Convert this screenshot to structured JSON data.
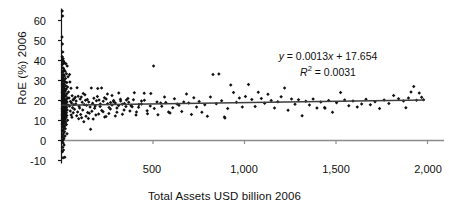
{
  "chart_data": {
    "type": "scatter",
    "title": "",
    "xlabel": "Total Assets USD billion 2006",
    "ylabel": "RoE (%) 2006",
    "xlim": [
      0,
      2000
    ],
    "ylim": [
      -10,
      65
    ],
    "xticks": [
      500,
      1000,
      1500,
      2000
    ],
    "xticklabels": [
      "500",
      "1,000",
      "1,500",
      "2,000"
    ],
    "yticks": [
      -10,
      0,
      10,
      20,
      30,
      40,
      50,
      60
    ],
    "yticklabels": [
      "-10",
      "0",
      "10",
      "20",
      "30",
      "40",
      "50",
      "60"
    ],
    "grid": false,
    "legend": null,
    "marker": "filled-diamond",
    "marker_color": "#111111",
    "trendline": {
      "slope": 0.0013,
      "intercept": 17.654,
      "r_squared": 0.0031,
      "color": "#3d3d3d",
      "x_start": 0,
      "x_end": 1985
    },
    "annotations": {
      "equation_y": "y",
      "equation_body": " = 0.0013",
      "equation_x": "x",
      "equation_tail": " + 17.654",
      "r2_symbol": "R",
      "r2_sup": "2",
      "r2_value": " = 0.0031"
    },
    "points": [
      [
        4,
        64.8
      ],
      [
        6,
        62.3
      ],
      [
        3,
        51.8
      ],
      [
        5,
        48.2
      ],
      [
        7,
        44.3
      ],
      [
        4,
        41.9
      ],
      [
        9,
        40.9
      ],
      [
        6,
        40.1
      ],
      [
        12,
        39.6
      ],
      [
        8,
        38.6
      ],
      [
        5,
        38.0
      ],
      [
        17,
        38.8
      ],
      [
        24,
        38.4
      ],
      [
        31,
        37.2
      ],
      [
        7,
        36.4
      ],
      [
        11,
        36.0
      ],
      [
        14,
        35.3
      ],
      [
        9,
        34.8
      ],
      [
        20,
        34.6
      ],
      [
        5,
        34.1
      ],
      [
        27,
        33.4
      ],
      [
        12,
        33.0
      ],
      [
        8,
        32.6
      ],
      [
        16,
        32.2
      ],
      [
        36,
        31.9
      ],
      [
        6,
        31.5
      ],
      [
        22,
        31.0
      ],
      [
        10,
        30.6
      ],
      [
        44,
        33.0
      ],
      [
        13,
        30.1
      ],
      [
        7,
        29.7
      ],
      [
        19,
        29.4
      ],
      [
        29,
        29.0
      ],
      [
        9,
        28.6
      ],
      [
        15,
        28.2
      ],
      [
        5,
        27.8
      ],
      [
        23,
        27.4
      ],
      [
        11,
        27.0
      ],
      [
        33,
        26.7
      ],
      [
        8,
        26.4
      ],
      [
        17,
        26.0
      ],
      [
        26,
        25.7
      ],
      [
        6,
        25.3
      ],
      [
        13,
        25.0
      ],
      [
        21,
        24.7
      ],
      [
        9,
        24.3
      ],
      [
        38,
        24.2
      ],
      [
        4,
        24.0
      ],
      [
        15,
        23.7
      ],
      [
        29,
        23.4
      ],
      [
        11,
        23.1
      ],
      [
        7,
        22.8
      ],
      [
        19,
        22.5
      ],
      [
        24,
        22.3
      ],
      [
        9,
        22.0
      ],
      [
        14,
        21.8
      ],
      [
        5,
        21.5
      ],
      [
        32,
        21.3
      ],
      [
        12,
        21.0
      ],
      [
        8,
        20.8
      ],
      [
        18,
        20.6
      ],
      [
        26,
        20.4
      ],
      [
        10,
        20.2
      ],
      [
        6,
        20.0
      ],
      [
        22,
        19.8
      ],
      [
        14,
        19.6
      ],
      [
        4,
        19.4
      ],
      [
        30,
        19.2
      ],
      [
        9,
        19.0
      ],
      [
        16,
        18.9
      ],
      [
        7,
        18.7
      ],
      [
        20,
        18.5
      ],
      [
        11,
        18.3
      ],
      [
        25,
        18.1
      ],
      [
        5,
        18.0
      ],
      [
        13,
        17.8
      ],
      [
        35,
        17.7
      ],
      [
        8,
        17.5
      ],
      [
        18,
        17.4
      ],
      [
        10,
        17.2
      ],
      [
        23,
        17.0
      ],
      [
        6,
        16.9
      ],
      [
        15,
        16.7
      ],
      [
        28,
        16.5
      ],
      [
        9,
        16.3
      ],
      [
        12,
        16.1
      ],
      [
        4,
        16.0
      ],
      [
        20,
        15.8
      ],
      [
        7,
        15.6
      ],
      [
        17,
        15.4
      ],
      [
        31,
        15.3
      ],
      [
        11,
        15.1
      ],
      [
        24,
        14.9
      ],
      [
        5,
        14.7
      ],
      [
        14,
        14.5
      ],
      [
        8,
        14.3
      ],
      [
        19,
        14.1
      ],
      [
        27,
        13.9
      ],
      [
        10,
        13.7
      ],
      [
        6,
        13.5
      ],
      [
        16,
        13.3
      ],
      [
        22,
        13.1
      ],
      [
        12,
        12.9
      ],
      [
        4,
        12.7
      ],
      [
        29,
        12.5
      ],
      [
        9,
        12.3
      ],
      [
        18,
        12.1
      ],
      [
        7,
        11.9
      ],
      [
        14,
        11.7
      ],
      [
        25,
        11.5
      ],
      [
        11,
        11.3
      ],
      [
        5,
        11.0
      ],
      [
        20,
        10.8
      ],
      [
        8,
        10.6
      ],
      [
        16,
        10.3
      ],
      [
        33,
        10.1
      ],
      [
        12,
        9.8
      ],
      [
        6,
        9.5
      ],
      [
        23,
        9.2
      ],
      [
        9,
        8.9
      ],
      [
        15,
        8.6
      ],
      [
        4,
        8.3
      ],
      [
        27,
        8.0
      ],
      [
        11,
        7.6
      ],
      [
        18,
        7.2
      ],
      [
        7,
        6.8
      ],
      [
        13,
        6.3
      ],
      [
        21,
        5.9
      ],
      [
        9,
        5.4
      ],
      [
        5,
        4.9
      ],
      [
        16,
        4.4
      ],
      [
        11,
        3.8
      ],
      [
        30,
        3.4
      ],
      [
        8,
        2.9
      ],
      [
        19,
        2.3
      ],
      [
        6,
        1.7
      ],
      [
        13,
        1.1
      ],
      [
        10,
        0.4
      ],
      [
        4,
        -0.3
      ],
      [
        9,
        -1.2
      ],
      [
        14,
        -2.3
      ],
      [
        7,
        -3.4
      ],
      [
        11,
        -4.8
      ],
      [
        5,
        -5.6
      ],
      [
        9,
        -8.6
      ],
      [
        18,
        -8.4
      ],
      [
        46,
        29.3
      ],
      [
        52,
        26.1
      ],
      [
        58,
        22.4
      ],
      [
        41,
        21.2
      ],
      [
        63,
        20.3
      ],
      [
        49,
        19.5
      ],
      [
        55,
        18.7
      ],
      [
        67,
        17.9
      ],
      [
        44,
        17.2
      ],
      [
        60,
        16.4
      ],
      [
        71,
        15.6
      ],
      [
        48,
        14.8
      ],
      [
        64,
        13.9
      ],
      [
        53,
        12.8
      ],
      [
        75,
        21.6
      ],
      [
        69,
        20.9
      ],
      [
        57,
        11.6
      ],
      [
        80,
        19.8
      ],
      [
        85,
        26.4
      ],
      [
        91,
        22.1
      ],
      [
        78,
        18.3
      ],
      [
        96,
        17.1
      ],
      [
        88,
        14.2
      ],
      [
        102,
        20.7
      ],
      [
        83,
        12.4
      ],
      [
        108,
        21.8
      ],
      [
        99,
        16.2
      ],
      [
        113,
        19.1
      ],
      [
        105,
        13.0
      ],
      [
        119,
        23.5
      ],
      [
        94,
        10.9
      ],
      [
        124,
        18.0
      ],
      [
        116,
        15.3
      ],
      [
        131,
        20.1
      ],
      [
        110,
        11.4
      ],
      [
        137,
        17.6
      ],
      [
        128,
        22.9
      ],
      [
        143,
        14.0
      ],
      [
        122,
        9.4
      ],
      [
        149,
        19.3
      ],
      [
        134,
        12.1
      ],
      [
        156,
        16.8
      ],
      [
        141,
        20.5
      ],
      [
        163,
        26.3
      ],
      [
        147,
        11.0
      ],
      [
        170,
        18.6
      ],
      [
        152,
        13.6
      ],
      [
        177,
        21.1
      ],
      [
        159,
        5.6
      ],
      [
        184,
        17.3
      ],
      [
        166,
        14.6
      ],
      [
        191,
        19.9
      ],
      [
        173,
        10.8
      ],
      [
        198,
        26.0
      ],
      [
        181,
        16.1
      ],
      [
        205,
        20.3
      ],
      [
        188,
        12.7
      ],
      [
        212,
        18.2
      ],
      [
        196,
        22.0
      ],
      [
        220,
        15.0
      ],
      [
        203,
        13.2
      ],
      [
        228,
        19.6
      ],
      [
        211,
        17.0
      ],
      [
        236,
        11.8
      ],
      [
        219,
        26.2
      ],
      [
        244,
        20.8
      ],
      [
        227,
        14.4
      ],
      [
        252,
        18.4
      ],
      [
        235,
        21.4
      ],
      [
        260,
        16.5
      ],
      [
        243,
        12.0
      ],
      [
        268,
        19.0
      ],
      [
        251,
        23.3
      ],
      [
        276,
        17.8
      ],
      [
        259,
        13.5
      ],
      [
        285,
        20.0
      ],
      [
        267,
        15.7
      ],
      [
        294,
        18.8
      ],
      [
        276,
        22.5
      ],
      [
        303,
        14.1
      ],
      [
        285,
        19.4
      ],
      [
        312,
        17.5
      ],
      [
        294,
        12.3
      ],
      [
        322,
        20.6
      ],
      [
        303,
        16.3
      ],
      [
        332,
        18.1
      ],
      [
        313,
        23.8
      ],
      [
        342,
        15.2
      ],
      [
        323,
        19.7
      ],
      [
        352,
        17.0
      ],
      [
        333,
        13.1
      ],
      [
        363,
        21.0
      ],
      [
        344,
        18.5
      ],
      [
        374,
        14.7
      ],
      [
        355,
        20.2
      ],
      [
        386,
        16.9
      ],
      [
        367,
        19.1
      ],
      [
        398,
        23.9
      ],
      [
        380,
        17.4
      ],
      [
        410,
        14.3
      ],
      [
        393,
        20.4
      ],
      [
        423,
        18.0
      ],
      [
        407,
        12.8
      ],
      [
        437,
        19.8
      ],
      [
        421,
        16.6
      ],
      [
        452,
        23.6
      ],
      [
        437,
        18.3
      ],
      [
        468,
        14.9
      ],
      [
        453,
        20.1
      ],
      [
        485,
        17.2
      ],
      [
        470,
        13.4
      ],
      [
        503,
        37.3
      ],
      [
        488,
        23.5
      ],
      [
        522,
        19.3
      ],
      [
        507,
        16.0
      ],
      [
        542,
        18.7
      ],
      [
        527,
        12.9
      ],
      [
        563,
        21.7
      ],
      [
        548,
        17.1
      ],
      [
        585,
        14.2
      ],
      [
        570,
        19.0
      ],
      [
        608,
        16.4
      ],
      [
        593,
        13.8
      ],
      [
        632,
        18.2
      ],
      [
        617,
        20.9
      ],
      [
        657,
        14.5
      ],
      [
        642,
        17.6
      ],
      [
        683,
        23.2
      ],
      [
        668,
        19.2
      ],
      [
        710,
        13.0
      ],
      [
        695,
        18.8
      ],
      [
        738,
        16.7
      ],
      [
        723,
        21.4
      ],
      [
        767,
        14.1
      ],
      [
        752,
        19.5
      ],
      [
        797,
        12.1
      ],
      [
        783,
        17.9
      ],
      [
        828,
        33.0
      ],
      [
        814,
        21.7
      ],
      [
        846,
        18.4
      ],
      [
        860,
        33.3
      ],
      [
        875,
        19.9
      ],
      [
        890,
        11.8
      ],
      [
        893,
        11.2
      ],
      [
        908,
        16.0
      ],
      [
        925,
        27.7
      ],
      [
        940,
        24.0
      ],
      [
        956,
        19.1
      ],
      [
        972,
        21.3
      ],
      [
        988,
        16.8
      ],
      [
        1005,
        22.0
      ],
      [
        1022,
        28.0
      ],
      [
        1040,
        20.5
      ],
      [
        1058,
        17.0
      ],
      [
        1075,
        24.1
      ],
      [
        1092,
        21.0
      ],
      [
        1110,
        18.6
      ],
      [
        1128,
        23.1
      ],
      [
        1146,
        20.0
      ],
      [
        1164,
        16.3
      ],
      [
        1182,
        19.4
      ],
      [
        1200,
        21.9
      ],
      [
        1219,
        26.2
      ],
      [
        1238,
        15.1
      ],
      [
        1257,
        20.7
      ],
      [
        1276,
        18.1
      ],
      [
        1295,
        20.4
      ],
      [
        1315,
        12.4
      ],
      [
        1335,
        19.6
      ],
      [
        1355,
        17.7
      ],
      [
        1375,
        20.8
      ],
      [
        1396,
        16.2
      ],
      [
        1417,
        19.2
      ],
      [
        1438,
        16.5
      ],
      [
        1440,
        16.1
      ],
      [
        1460,
        20.0
      ],
      [
        1481,
        14.1
      ],
      [
        1503,
        18.9
      ],
      [
        1525,
        24.0
      ],
      [
        1547,
        20.3
      ],
      [
        1570,
        17.4
      ],
      [
        1593,
        19.8
      ],
      [
        1616,
        16.7
      ],
      [
        1640,
        18.2
      ],
      [
        1664,
        20.6
      ],
      [
        1688,
        17.9
      ],
      [
        1713,
        19.4
      ],
      [
        1738,
        16.0
      ],
      [
        1763,
        20.2
      ],
      [
        1789,
        18.5
      ],
      [
        1815,
        22.5
      ],
      [
        1842,
        20.9
      ],
      [
        1869,
        19.7
      ],
      [
        1882,
        16.4
      ],
      [
        1896,
        21.2
      ],
      [
        1910,
        24.2
      ],
      [
        1925,
        27.0
      ],
      [
        1940,
        20.1
      ],
      [
        1955,
        23.8
      ],
      [
        1968,
        21.6
      ],
      [
        1978,
        20.4
      ]
    ]
  }
}
